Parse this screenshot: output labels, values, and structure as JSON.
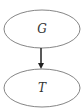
{
  "diagram": {
    "nodes": [
      {
        "id": "G",
        "label": "G"
      },
      {
        "id": "T",
        "label": "T"
      }
    ],
    "edges": [
      {
        "from": "G",
        "to": "T",
        "directed": true
      }
    ],
    "colors": {
      "stroke": "#555555",
      "arrow": "#222222",
      "text": "#333333",
      "background": "#ffffff"
    }
  }
}
